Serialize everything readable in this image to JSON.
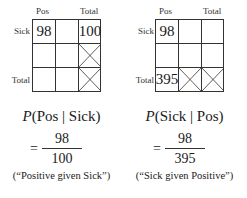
{
  "left": {
    "col_labels": [
      "Pos",
      "Total"
    ],
    "row_labels": [
      "Sick",
      "Total"
    ],
    "cells": {
      "r0c0": "98",
      "r0c2": "100"
    },
    "crossed_cells": [
      "r1c2",
      "r2c2"
    ],
    "formula": {
      "prefix": "P",
      "expression": "(Pos | Sick)",
      "numerator": "98",
      "denominator": "100",
      "caption": "(“Positive given Sick”)"
    }
  },
  "right": {
    "col_labels": [
      "Pos",
      "Total"
    ],
    "row_labels": [
      "Sick",
      "Total"
    ],
    "cells": {
      "r0c0": "98",
      "r2c0": "395"
    },
    "crossed_cells": [
      "r2c1",
      "r2c2"
    ],
    "formula": {
      "prefix": "P",
      "expression": "(Sick | Pos)",
      "numerator": "98",
      "denominator": "395",
      "caption": "(“Sick given Positive”)"
    }
  },
  "equals_sign": "="
}
